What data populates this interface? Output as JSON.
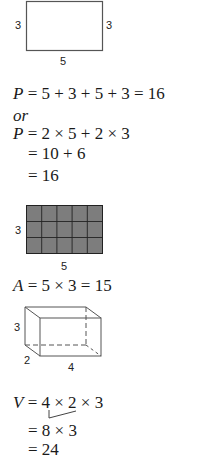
{
  "perimeter": {
    "figure": {
      "shape": "rectangle",
      "left_label": "3",
      "right_label": "3",
      "bottom_label": "5"
    },
    "lines": [
      {
        "var": "P",
        "expr": " = 5 + 3 + 5 + 3 = 16"
      },
      {
        "word": "or"
      },
      {
        "var": "P",
        "expr": " = 2 × 5 + 2 × 3"
      },
      {
        "expr": "= 10 + 6"
      },
      {
        "expr": "= 16"
      }
    ]
  },
  "area": {
    "figure": {
      "shape": "grid",
      "rows": 3,
      "cols": 5,
      "fill": "#7a7a7a",
      "left_label": "3",
      "bottom_label": "5"
    },
    "lines": [
      {
        "var": "A",
        "expr": " = 5 × 3 = 15"
      }
    ]
  },
  "volume": {
    "figure": {
      "shape": "rectangular-prism",
      "height_label": "3",
      "depth_label": "2",
      "width_label": "4"
    },
    "lines": [
      {
        "var": "V",
        "expr": " = 4 × 2 × 3"
      },
      {
        "expr": "= 8 × 3"
      },
      {
        "expr": "= 24"
      }
    ]
  }
}
